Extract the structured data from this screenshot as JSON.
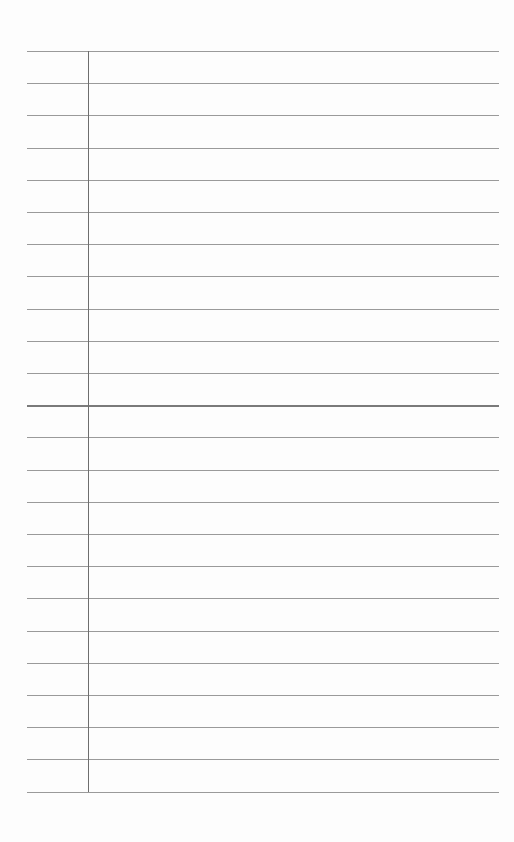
{
  "page": {
    "type": "lined-paper",
    "background": "#fdfdfd",
    "rule_color": "#9a9a9a",
    "margin_color": "#6e6e6e",
    "rule_count": 24,
    "first_rule_y": 51,
    "rule_spacing": 32.2,
    "margin_x": 88,
    "strong_rule_index": 11
  }
}
